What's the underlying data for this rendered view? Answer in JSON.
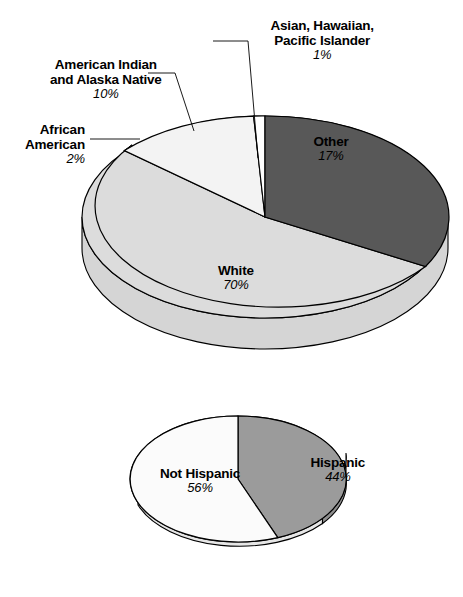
{
  "figure": {
    "background": "#ffffff",
    "charts": [
      {
        "id": "race-pie",
        "type": "pie",
        "title": "",
        "slices": [
          {
            "label": "Other",
            "pct": 17,
            "pct_text": "17%",
            "color": "#585858",
            "label_placement": "inside"
          },
          {
            "label": "White",
            "pct": 70,
            "pct_text": "70%",
            "color": "#dcdcdc",
            "label_placement": "inside"
          },
          {
            "label": "African American",
            "pct": 2,
            "pct_text": "2%",
            "color": "#555555",
            "label_placement": "leader"
          },
          {
            "label": "American Indian and Alaska Native",
            "pct": 10,
            "pct_text": "10%",
            "color": "#f3f3f3",
            "label_placement": "leader"
          },
          {
            "label": "Asian, Hawaiian, Pacific Islander",
            "pct": 1,
            "pct_text": "1%",
            "color": "#ffffff",
            "label_placement": "leader"
          }
        ]
      },
      {
        "id": "ethnicity-pie",
        "type": "pie",
        "title": "",
        "slices": [
          {
            "label": "Hispanic",
            "pct": 44,
            "pct_text": "44%",
            "color": "#9b9b9b",
            "label_placement": "inside"
          },
          {
            "label": "Not Hispanic",
            "pct": 56,
            "pct_text": "56%",
            "color": "#fbfbfb",
            "label_placement": "inside"
          }
        ]
      }
    ]
  },
  "labels": {
    "asian": {
      "line1": "Asian, Hawaiian,",
      "line2": "Pacific Islander",
      "pct": "1%"
    },
    "american_indian": {
      "line1": "American Indian",
      "line2": "and Alaska Native",
      "pct": "10%"
    },
    "african_american": {
      "line1": "African",
      "line2": "American",
      "pct": "2%"
    },
    "other": {
      "line1": "Other",
      "pct": "17%"
    },
    "white": {
      "line1": "White",
      "pct": "70%"
    },
    "hispanic": {
      "line1": "Hispanic",
      "pct": "44%"
    },
    "not_hispanic": {
      "line1": "Not Hispanic",
      "pct": "56%"
    }
  },
  "chart_data": [
    {
      "type": "pie",
      "title": "Race distribution",
      "categories": [
        "White",
        "Other",
        "American Indian and Alaska Native",
        "African American",
        "Asian, Hawaiian, Pacific Islander"
      ],
      "values": [
        70,
        17,
        10,
        2,
        1
      ],
      "value_labels": [
        "70%",
        "17%",
        "10%",
        "2%",
        "1%"
      ],
      "unit": "percent",
      "colors": [
        "#dcdcdc",
        "#585858",
        "#f3f3f3",
        "#555555",
        "#ffffff"
      ],
      "legend": "none",
      "style": "3d-pie",
      "xlabel": "",
      "ylabel": ""
    },
    {
      "type": "pie",
      "title": "Ethnicity distribution",
      "categories": [
        "Not Hispanic",
        "Hispanic"
      ],
      "values": [
        56,
        44
      ],
      "value_labels": [
        "56%",
        "44%"
      ],
      "unit": "percent",
      "colors": [
        "#fbfbfb",
        "#9b9b9b"
      ],
      "legend": "none",
      "style": "3d-pie",
      "xlabel": "",
      "ylabel": ""
    }
  ]
}
